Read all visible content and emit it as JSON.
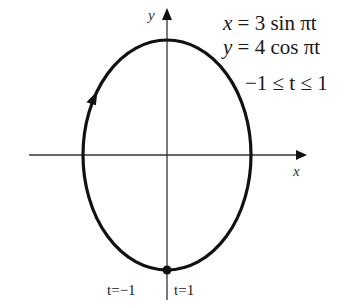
{
  "figure": {
    "equations": {
      "x_eq": {
        "var": "x",
        "rhs": "= 3 sin πt"
      },
      "y_eq": {
        "var": "y",
        "rhs": "= 4 cos πt"
      },
      "range": "−1 ≤ t ≤ 1"
    },
    "axes": {
      "x_label": "x",
      "y_label": "y"
    },
    "point_labels": {
      "start": "t=−1",
      "end": "t=1"
    },
    "curve": {
      "type": "ellipse",
      "x_amplitude": 3,
      "y_amplitude": 4,
      "direction": "clockwise from bottom",
      "start_end_point": [
        0,
        -4
      ]
    },
    "colors": {
      "curve": "#111111",
      "axis": "#333333"
    }
  }
}
